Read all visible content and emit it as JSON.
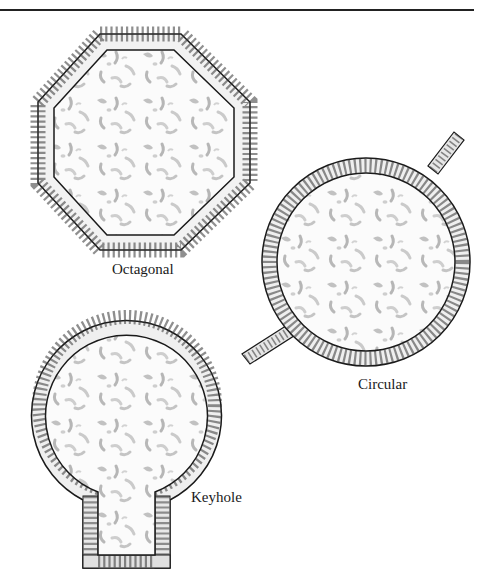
{
  "figure": {
    "shapes": [
      {
        "id": "octagonal",
        "label": "Octagonal"
      },
      {
        "id": "circular",
        "label": "Circular"
      },
      {
        "id": "keyhole",
        "label": "Keyhole"
      }
    ]
  },
  "colors": {
    "ink": "#1a1a1a",
    "stone_light": "#f4f4f4",
    "stone_mid": "#bdbdbd",
    "stone_dark": "#6e6e6e",
    "texture": "#9a9a9a"
  }
}
